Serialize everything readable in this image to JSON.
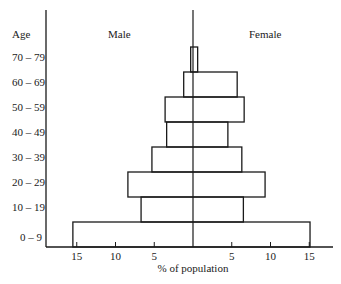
{
  "chart_data": {
    "type": "bar",
    "subtype": "population-pyramid",
    "title": "",
    "ylabel": "Age",
    "xlabel": "% of population",
    "legend": [
      "Male",
      "Female"
    ],
    "categories": [
      "0 – 9",
      "10 – 19",
      "20 – 29",
      "30 – 39",
      "40 – 49",
      "50 – 59",
      "60 – 69",
      "70 – 79"
    ],
    "series": [
      {
        "name": "Male",
        "side": "left",
        "values": [
          15.5,
          6.7,
          8.4,
          5.3,
          3.4,
          3.6,
          1.2,
          0.3
        ]
      },
      {
        "name": "Female",
        "side": "right",
        "values": [
          15.1,
          6.5,
          9.3,
          6.3,
          4.5,
          6.6,
          5.7,
          0.6
        ]
      }
    ],
    "x_ticks_left": [
      "15",
      "10",
      "5"
    ],
    "x_ticks_right": [
      "5",
      "10",
      "15"
    ],
    "xlim": [
      -17,
      17
    ],
    "grid": false
  }
}
